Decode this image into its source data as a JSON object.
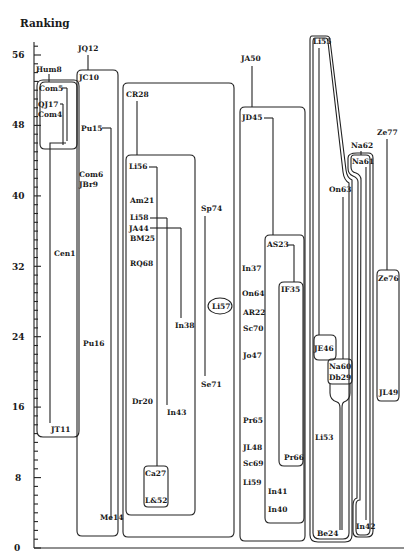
{
  "title": "Ranking",
  "y_axis": {
    "ticks": [
      "0",
      "8",
      "16",
      "24",
      "32",
      "40",
      "48",
      "56"
    ],
    "min": 0,
    "max": 56
  },
  "labels": {
    "Hum8": "Hum8",
    "Com5": "Com5",
    "QJ17": "QJ17",
    "Com4": "Com4",
    "Cen1": "Cen1",
    "JT11": "JT11",
    "JQ12": "JQ12",
    "JC10": "JC10",
    "Pu15": "Pu15",
    "Com6": "Com6",
    "JBr9": "JBr9",
    "Pu16": "Pu16",
    "Me14": "Me14",
    "CR28": "CR28",
    "Li56": "Li56",
    "Am21": "Am21",
    "Li58": "Li58",
    "JA44": "JA44",
    "BM25": "BM25",
    "RQ68": "RQ68",
    "In38": "In38",
    "Dr20": "Dr20",
    "In43": "In43",
    "Ca27": "Ca27",
    "L&52": "L&52",
    "Sp74": "Sp74",
    "Se71": "Se71",
    "Li57": "Li57",
    "JA50": "JA50",
    "JD45": "JD45",
    "AS23": "AS23",
    "In37": "In37",
    "On64": "On64",
    "IF35": "IF35",
    "AR22": "AR22",
    "Sc70": "Sc70",
    "Jo47": "Jo47",
    "Pr65": "Pr65",
    "JL48": "JL48",
    "Sc69": "Sc69",
    "Li59": "Li59",
    "In41": "In41",
    "In40": "In40",
    "Pr66": "Pr66",
    "Li55": "Li55",
    "JE46": "JE46",
    "Li53": "Li53",
    "Be24": "Be24",
    "On63": "On63",
    "Na60": "Na60",
    "Db29": "Db29",
    "Na62": "Na62",
    "Na61": "Na61",
    "In42": "In42",
    "Ze77": "Ze77",
    "Ze76": "Ze76",
    "JL49": "JL49"
  },
  "chart_data": {
    "type": "diagram",
    "title": "Ranking",
    "ylabel": "Ranking",
    "ylim": [
      0,
      56
    ],
    "yticks": [
      0,
      8,
      16,
      24,
      32,
      40,
      48,
      56
    ],
    "groups": [
      {
        "box": "Hum8-group",
        "members": [
          "Com5",
          "QJ17",
          "Com4",
          "Cen1",
          "JT11"
        ],
        "head": "Hum8",
        "range": [
          12,
          53
        ]
      },
      {
        "box": "JQ12-group",
        "members": [
          "JC10",
          "Pu15",
          "Com6",
          "JBr9",
          "Pu16",
          "Me14"
        ],
        "head": "JQ12",
        "range": [
          2,
          54
        ]
      },
      {
        "box": "CR28-group",
        "members": [
          "CR28",
          "Sp74",
          "Se71",
          "Li57"
        ],
        "range": [
          1,
          50
        ]
      },
      {
        "box": "Li56-group",
        "members": [
          "Li56",
          "Am21",
          "Li58",
          "JA44",
          "BM25",
          "RQ68",
          "In38",
          "Dr20",
          "In43"
        ],
        "range": [
          4,
          41
        ]
      },
      {
        "box": "Ca27-group",
        "members": [
          "Ca27",
          "L&52"
        ],
        "range": [
          4,
          9
        ]
      },
      {
        "box": "JA50-group",
        "head": "JA50",
        "members": [
          "JD45",
          "In37",
          "On64",
          "AR22",
          "Sc70",
          "Jo47",
          "Pr65",
          "JL48",
          "Sc69",
          "Li59"
        ],
        "range": [
          1,
          47
        ]
      },
      {
        "box": "AS23-group",
        "members": [
          "AS23",
          "In41",
          "In40"
        ],
        "range": [
          3,
          35
        ]
      },
      {
        "box": "IF35-group",
        "members": [
          "IF35",
          "Pr66"
        ],
        "range": [
          10,
          30
        ]
      },
      {
        "box": "Li55-group",
        "members": [
          "Li55",
          "Li53",
          "Be24"
        ],
        "range": [
          0.5,
          58
        ]
      },
      {
        "box": "JE46-group",
        "members": [
          "JE46"
        ],
        "range": [
          1,
          25
        ]
      },
      {
        "box": "Na60-group",
        "members": [
          "Na60",
          "Db29",
          "On63"
        ],
        "range": [
          1,
          22
        ]
      },
      {
        "box": "Na61-group",
        "head": "Na62",
        "members": [
          "Na61",
          "In42"
        ],
        "range": [
          2,
          45
        ]
      },
      {
        "box": "Ze76-group",
        "head": "Ze77",
        "members": [
          "Ze76",
          "JL49"
        ],
        "range": [
          17,
          36
        ]
      }
    ]
  }
}
